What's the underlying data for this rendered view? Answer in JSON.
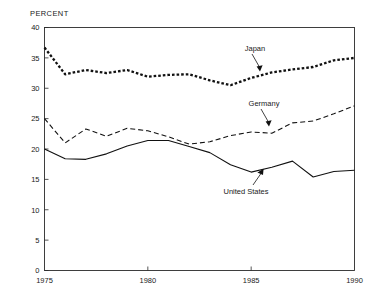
{
  "chart_data": {
    "type": "line",
    "title": "",
    "xlabel": "",
    "ylabel": "PERCENT",
    "xlim": [
      1975,
      1990
    ],
    "ylim": [
      0,
      40
    ],
    "grid": false,
    "legend_position": "inline-annotations",
    "x_ticks": [
      1975,
      1980,
      1985,
      1990
    ],
    "x_tick_labels": [
      "1975",
      "1980",
      "1985",
      "1990"
    ],
    "y_ticks": [
      0,
      5,
      10,
      15,
      20,
      25,
      30,
      35,
      40
    ],
    "y_tick_labels": [
      "0",
      "5",
      "10",
      "15",
      "20",
      "25",
      "30",
      "35",
      "40"
    ],
    "x": [
      1975,
      1976,
      1977,
      1978,
      1979,
      1980,
      1981,
      1982,
      1983,
      1984,
      1985,
      1986,
      1987,
      1988,
      1989,
      1990
    ],
    "series": [
      {
        "name": "Japan",
        "style": "dotted-thick",
        "values": [
          36.7,
          32.3,
          33.0,
          32.5,
          33.0,
          31.9,
          32.2,
          32.3,
          31.3,
          30.5,
          31.7,
          32.6,
          33.1,
          33.5,
          34.6,
          35.0
        ]
      },
      {
        "name": "Germany",
        "style": "dashed",
        "values": [
          25.0,
          21.0,
          23.3,
          22.1,
          23.4,
          23.0,
          22.0,
          20.8,
          21.2,
          22.2,
          22.8,
          22.6,
          24.3,
          24.6,
          25.8,
          27.1
        ]
      },
      {
        "name": "United States",
        "style": "solid",
        "values": [
          20.0,
          18.4,
          18.3,
          19.2,
          20.5,
          21.4,
          21.4,
          20.4,
          19.4,
          17.4,
          16.2,
          17.0,
          18.0,
          17.3,
          16.2,
          15.4
        ]
      }
    ],
    "us_tail": {
      "note": "United States continues 1988-1990",
      "x": [
        1988,
        1989,
        1990
      ],
      "values": [
        15.4,
        16.3,
        16.5
      ]
    },
    "annotations": [
      {
        "name": "Japan",
        "label": "Japan"
      },
      {
        "name": "Germany",
        "label": "Germany"
      },
      {
        "name": "United States",
        "label": "United States"
      }
    ]
  },
  "axis": {
    "y_title": "PERCENT"
  },
  "labels": {
    "japan": "Japan",
    "germany": "Germany",
    "united_states": "United States"
  }
}
